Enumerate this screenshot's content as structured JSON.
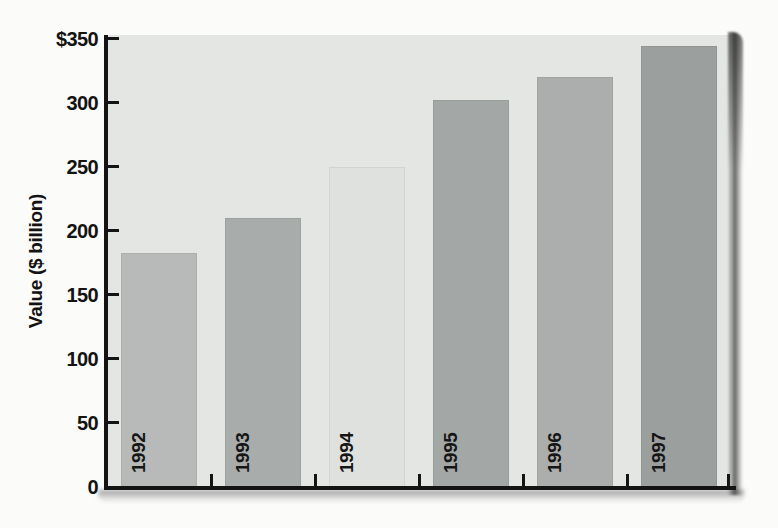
{
  "figure": {
    "background": "#fbfbfa",
    "panel_background": "#e4e6e3",
    "axis_color": "#141414",
    "shadow_color": "#6e6e6e"
  },
  "chart_data": {
    "type": "bar",
    "title": "",
    "ylabel": "Value ($ billion)",
    "xlabel": "",
    "categories": [
      "1992",
      "1993",
      "1994",
      "1995",
      "1996",
      "1997"
    ],
    "values": [
      183,
      210,
      250,
      302,
      320,
      344
    ],
    "unit": "$ billion",
    "ylim": [
      0,
      350
    ],
    "ytick_step": 50,
    "yticks": [
      {
        "value": 0,
        "label": "0"
      },
      {
        "value": 50,
        "label": "50"
      },
      {
        "value": 100,
        "label": "100"
      },
      {
        "value": 150,
        "label": "150"
      },
      {
        "value": 200,
        "label": "200"
      },
      {
        "value": 250,
        "label": "250"
      },
      {
        "value": 300,
        "label": "300"
      },
      {
        "value": 350,
        "label": "$350"
      }
    ],
    "bar_colors": [
      "#b7bab8",
      "#a8acaa",
      "#dfe1de",
      "#a3a7a5",
      "#abaeac",
      "#9b9f9d"
    ],
    "bar_label_position": "inside-bottom-rotated",
    "grid": false,
    "legend": null
  }
}
